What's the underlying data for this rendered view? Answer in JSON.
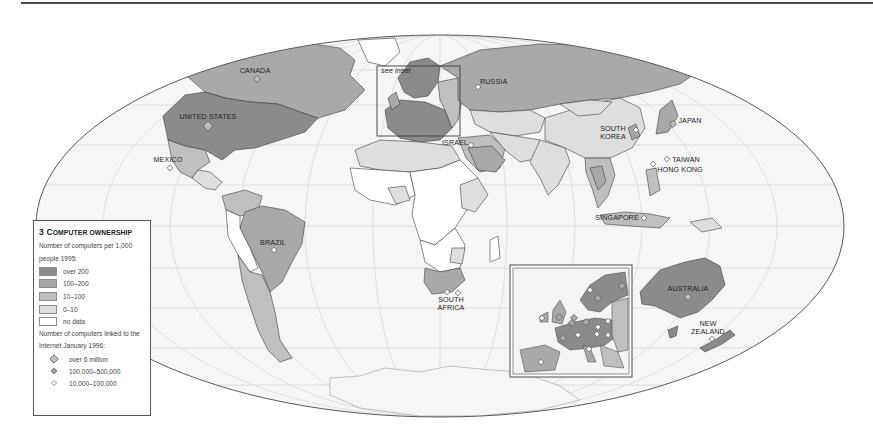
{
  "map": {
    "projection": "world ellipse (Mollweide-like)",
    "inset_label": "see inset",
    "country_labels": [
      {
        "name": "CANADA",
        "x": 255,
        "y": 72
      },
      {
        "name": "UNITED STATES",
        "x": 209,
        "y": 118
      },
      {
        "name": "MEXICO",
        "x": 167,
        "y": 161
      },
      {
        "name": "BRAZIL",
        "x": 273,
        "y": 244
      },
      {
        "name": "RUSSIA",
        "x": 494,
        "y": 83
      },
      {
        "name": "ISRAEL",
        "x": 452,
        "y": 144
      },
      {
        "name": "SOUTH",
        "x": 613,
        "y": 130
      },
      {
        "name": "KOREA",
        "x": 613,
        "y": 138
      },
      {
        "name": "JAPAN",
        "x": 692,
        "y": 123
      },
      {
        "name": "TAIWAN",
        "x": 680,
        "y": 161
      },
      {
        "name": "HONG KONG",
        "x": 658,
        "y": 171
      },
      {
        "name": "SINGAPORE",
        "x": 597,
        "y": 219
      },
      {
        "name": "SOUTH",
        "x": 451,
        "y": 302
      },
      {
        "name": "AFRICA",
        "x": 451,
        "y": 310
      },
      {
        "name": "AUSTRALIA",
        "x": 688,
        "y": 292
      },
      {
        "name": "NEW",
        "x": 710,
        "y": 326
      },
      {
        "name": "ZEALAND",
        "x": 710,
        "y": 334
      }
    ],
    "colors": {
      "over_200": "#8b8b8b",
      "100_200": "#a9a9a9",
      "10_100": "#bfbfbf",
      "0_10": "#dedede",
      "no_data": "#ffffff",
      "ocean": "#f6f6f6",
      "graticule": "#d9d9d9",
      "border": "#3c3c3c"
    }
  },
  "legend": {
    "number": "3",
    "title_big": "C",
    "title_small": "OMPUTER OWNERSHIP",
    "subtitle1_line1": "Number of computers per 1,000",
    "subtitle1_line2": "people 1995:",
    "swatches": [
      {
        "label": "over 200",
        "color": "#8b8b8b"
      },
      {
        "label": "100–200",
        "color": "#a9a9a9"
      },
      {
        "label": "10–100",
        "color": "#bfbfbf"
      },
      {
        "label": "0–10",
        "color": "#dedede"
      },
      {
        "label": "no data",
        "color": "#ffffff"
      }
    ],
    "subtitle2_line1": "Number of computers linked to the",
    "subtitle2_line2": "Internet January 1996:",
    "markers": [
      {
        "label": "over 6 million",
        "size": "large"
      },
      {
        "label": "100,000–500,000",
        "size": "medium"
      },
      {
        "label": "10,000–100,000",
        "size": "small"
      }
    ]
  }
}
